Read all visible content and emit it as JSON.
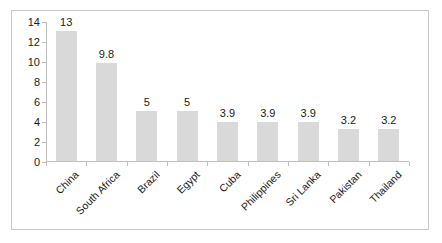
{
  "chart_data": {
    "type": "bar",
    "title": "",
    "subtitle": "",
    "xlabel": "",
    "ylabel": "",
    "categories": [
      "China",
      "South Africa",
      "Brazil",
      "Egypt",
      "Cuba",
      "Philippines",
      "Sri Lanka",
      "Pakistan",
      "Thailand"
    ],
    "values": [
      13,
      9.8,
      5,
      5,
      3.9,
      3.9,
      3.9,
      3.2,
      3.2
    ],
    "data_labels": [
      "13",
      "9.8",
      "5",
      "5",
      "3.9",
      "3.9",
      "3.9",
      "3.2",
      "3.2"
    ],
    "ylim": [
      0,
      14
    ],
    "ytick_values": [
      0,
      2,
      4,
      6,
      8,
      10,
      12,
      14
    ],
    "ytick_labels": [
      "0",
      "2",
      "4",
      "6",
      "8",
      "10",
      "12",
      "14"
    ],
    "grid": false,
    "legend": false,
    "legend_position": "none",
    "bar_color": "#d9d9d9",
    "axis_color": "#bfbfbf",
    "border_color": "#c8c8c8",
    "text_color": "#1a1a1a",
    "background": "#ffffff"
  }
}
